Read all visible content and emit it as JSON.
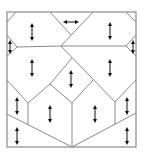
{
  "diagram": {
    "line_color": "#8a8a8a",
    "arrow_color": "#111111",
    "region_count": 14,
    "arrows": [
      {
        "region": "top-left",
        "direction": "vertical"
      },
      {
        "region": "top-center",
        "direction": "horizontal"
      },
      {
        "region": "top-right",
        "direction": "vertical"
      },
      {
        "region": "left-notch",
        "direction": "vertical"
      },
      {
        "region": "right-notch",
        "direction": "vertical"
      },
      {
        "region": "middle-left",
        "direction": "vertical"
      },
      {
        "region": "middle-right",
        "direction": "vertical"
      },
      {
        "region": "center-diamond",
        "direction": "vertical"
      },
      {
        "region": "lower-left-edge",
        "direction": "vertical"
      },
      {
        "region": "lower-left-house",
        "direction": "vertical"
      },
      {
        "region": "lower-right-house",
        "direction": "vertical"
      },
      {
        "region": "lower-right-edge",
        "direction": "vertical"
      },
      {
        "region": "bottom-left",
        "direction": "vertical"
      },
      {
        "region": "bottom-right",
        "direction": "vertical"
      }
    ]
  }
}
